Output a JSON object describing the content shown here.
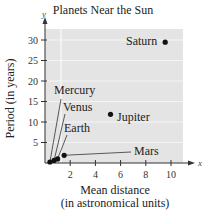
{
  "chart_data": {
    "type": "scatter",
    "title": "Planets Near the Sun",
    "xlabel": "Mean distance (in astronomical units)",
    "xlabel_line1": "Mean distance",
    "xlabel_line2": "(in astronomical units)",
    "ylabel": "Period (in years)",
    "x_axis_letter": "x",
    "y_axis_letter": "y",
    "xlim": [
      0,
      11
    ],
    "ylim": [
      0,
      32
    ],
    "xticks": [
      2,
      4,
      6,
      8,
      10
    ],
    "yticks": [
      5,
      10,
      15,
      20,
      25,
      30
    ],
    "grid": true,
    "points": [
      {
        "name": "Mercury",
        "x": 0.39,
        "y": 0.24
      },
      {
        "name": "Venus",
        "x": 0.72,
        "y": 0.62
      },
      {
        "name": "Earth",
        "x": 1.0,
        "y": 1.0
      },
      {
        "name": "Mars",
        "x": 1.52,
        "y": 1.88
      },
      {
        "name": "Jupiter",
        "x": 5.2,
        "y": 11.86
      },
      {
        "name": "Saturn",
        "x": 9.54,
        "y": 29.46
      }
    ],
    "colors": {
      "plot_bg": "#e4e4e4",
      "grid": "#f4f4f4",
      "point": "#111111",
      "axis": "#333333"
    }
  }
}
